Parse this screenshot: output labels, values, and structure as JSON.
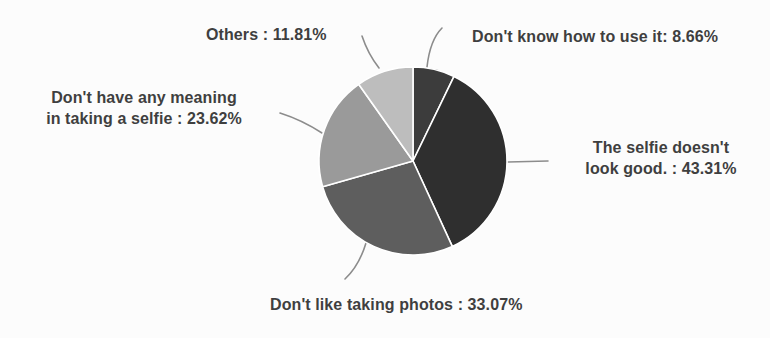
{
  "chart_data": {
    "type": "pie",
    "title": "",
    "start_angle_deg": -90,
    "direction": "clockwise",
    "legend_position": "none",
    "unit": "%",
    "segments": [
      {
        "label": "Don't know how to use it",
        "value": 8.66,
        "color": "#3c3c3c"
      },
      {
        "label": "The selfie doesn't look good.",
        "value": 43.31,
        "color": "#2f2f2f"
      },
      {
        "label": "Don't like taking photos",
        "value": 33.07,
        "color": "#5e5e5e"
      },
      {
        "label": "Don't have any meaning in taking a selfie",
        "value": 23.62,
        "color": "#9a9a9a"
      },
      {
        "label": "Others",
        "value": 11.81,
        "color": "#bdbdbd"
      }
    ]
  },
  "labels": {
    "others": "Others : 11.81%",
    "dont_know": "Don't know how to use it: 8.66%",
    "no_meaning": "Don't have any meaning\nin taking a selfie : 23.62%",
    "not_good": "The selfie doesn't\nlook good. : 43.31%",
    "dont_like": "Don't like taking photos : 33.07%"
  },
  "colors": {
    "text": "#3f3f3f",
    "background": "#fcfcfc",
    "divider": "#ffffff",
    "leader_line": "#8c8c8c"
  }
}
